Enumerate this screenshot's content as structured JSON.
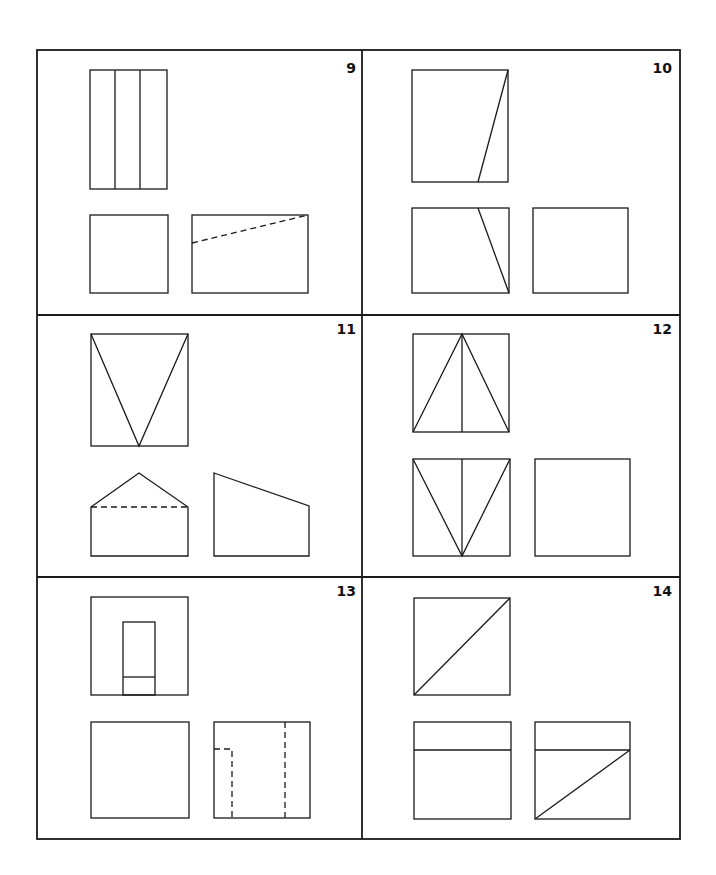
{
  "panels": [
    {
      "number": "9",
      "views": [
        "top view: tall rectangle divided into three vertical strips",
        "front view: square",
        "side view: rectangle with dashed sloping hidden line"
      ]
    },
    {
      "number": "10",
      "views": [
        "top view: rectangle with slanted line",
        "front view: rectangle with slanted line",
        "side view: empty rectangle"
      ]
    },
    {
      "number": "11",
      "views": [
        "top view: rectangle with V lines",
        "front view: pentagon with dashed hidden line",
        "side view: trapezoid with sloped top"
      ]
    },
    {
      "number": "12",
      "views": [
        "top view: rectangle with triangle and center line",
        "front view: rectangle with inverted triangle and center line",
        "side view: empty square"
      ]
    },
    {
      "number": "13",
      "views": [
        "top view: square with inner rectangle",
        "front view: empty square",
        "side view: square with dashed hidden lines"
      ]
    },
    {
      "number": "14",
      "views": [
        "top view: square with diagonal",
        "front view: rectangle with horizontal line",
        "side view: rectangle with horizontal line and diagonal"
      ]
    }
  ],
  "colors": {
    "ink": "#1a1a1a",
    "background": "#ffffff"
  }
}
